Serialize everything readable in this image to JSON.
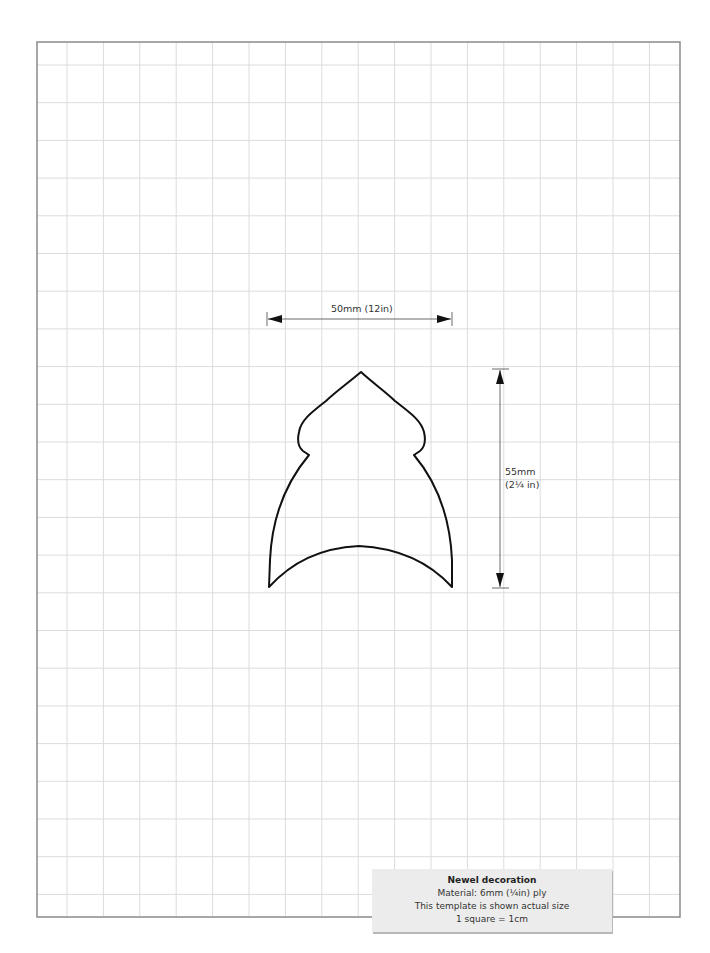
{
  "template": {
    "title": "Newel decoration",
    "material": "Material:  6mm (¼in) ply",
    "scale_note": "This template is shown actual size",
    "grid_note": "1 square = 1cm"
  },
  "dimensions": {
    "width_label": "50mm (12in)",
    "height_label_line1": "55mm",
    "height_label_line2": "(2¼ in)"
  },
  "colors": {
    "grid_line": "#dcdcdc",
    "frame": "#888888",
    "outline": "#111111",
    "caption_bg": "#ececec"
  }
}
